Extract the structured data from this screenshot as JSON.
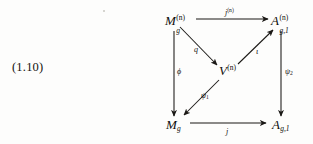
{
  "equation": {
    "number": "(1.10)"
  },
  "diagram": {
    "type": "commutative-diagram",
    "nodes": [
      {
        "id": "Mgn",
        "base": "M",
        "sub": "g",
        "sup": "(n)",
        "text": "M_g^{(n)}",
        "position": "top-left",
        "x": 170,
        "y": 22
      },
      {
        "id": "Agn",
        "base": "A",
        "sub": "g,1",
        "sup": "(n)",
        "text": "A_{g,1}^{(n)}",
        "position": "top-right",
        "x": 276,
        "y": 22
      },
      {
        "id": "Vn",
        "base": "V",
        "sub": "",
        "sup": "(n)",
        "text": "V^{(n)}",
        "position": "center",
        "x": 224,
        "y": 72
      },
      {
        "id": "Mg",
        "base": "M",
        "sub": "g",
        "sup": "",
        "text": "M_g",
        "position": "bottom-left",
        "x": 170,
        "y": 126
      },
      {
        "id": "Ag",
        "base": "A",
        "sub": "g,1",
        "sup": "",
        "text": "A_{g,1}",
        "position": "bottom-right",
        "x": 276,
        "y": 126
      }
    ],
    "arrows": [
      {
        "id": "jn",
        "from": "Mgn",
        "to": "Agn",
        "label": "j",
        "label_sup": "(n)",
        "label_sub": "",
        "direction": "right"
      },
      {
        "id": "q",
        "from": "Mgn",
        "to": "Vn",
        "label": "q",
        "label_sup": "",
        "label_sub": "",
        "direction": "down-right"
      },
      {
        "id": "iota",
        "from": "Vn",
        "to": "Agn",
        "label": "ι",
        "label_sup": "",
        "label_sub": "",
        "direction": "up-right"
      },
      {
        "id": "phi",
        "from": "Mgn",
        "to": "Mg",
        "label": "ϕ",
        "label_sup": "",
        "label_sub": "",
        "direction": "down"
      },
      {
        "id": "psi1",
        "from": "Vn",
        "to": "Mg",
        "label": "ψ",
        "label_sup": "",
        "label_sub": "1",
        "direction": "down-left"
      },
      {
        "id": "psi2",
        "from": "Agn",
        "to": "Ag",
        "label": "ψ",
        "label_sup": "",
        "label_sub": "2",
        "direction": "down"
      },
      {
        "id": "j",
        "from": "Mg",
        "to": "Ag",
        "label": "j",
        "label_sup": "",
        "label_sub": "",
        "direction": "right"
      }
    ],
    "labels": {
      "jn": "j",
      "jn_sup": "(n)",
      "q": "q",
      "iota": "ι",
      "phi": "ϕ",
      "psi1": "ψ",
      "psi1_sub": "1",
      "psi2": "ψ",
      "psi2_sub": "2",
      "j": "j"
    },
    "node_text": {
      "Mgn_base": "M",
      "Mgn_sup": "(n)",
      "Mgn_sub": "g",
      "Agn_base": "A",
      "Agn_sup": "(n)",
      "Agn_sub": "g,1",
      "Vn_base": "V",
      "Vn_sup": "(n)",
      "Mg_base": "M",
      "Mg_sub": "g",
      "Ag_base": "A",
      "Ag_sub": "g,1"
    }
  },
  "colors": {
    "ink": "#100e0b",
    "paper": "#fdfdfc",
    "rule": "#1a1815"
  }
}
